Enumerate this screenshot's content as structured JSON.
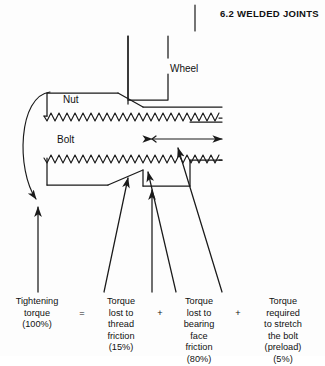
{
  "header": {
    "title": "6.2 WELDED JOINTS"
  },
  "diagram": {
    "labels": {
      "wheel": "Wheel",
      "nut": "Nut",
      "bolt": "Bolt"
    },
    "annotations": {
      "stretch_arrow": "double-headed-arrow",
      "tightening_arc": "curved-torque-arrow"
    },
    "colors": {
      "line": "#1a1a1a",
      "background": "#fdfdfd",
      "text": "#111111"
    }
  },
  "caption": {
    "operators": {
      "equals": "=",
      "plus": "+"
    },
    "columns": [
      {
        "lines": [
          "Tightening",
          "torque",
          "(100%)"
        ],
        "percent": "100%"
      },
      {
        "lines": [
          "Torque",
          "lost to",
          "thread",
          "friction",
          "(15%)"
        ],
        "percent": "15%"
      },
      {
        "lines": [
          "Torque",
          "lost to",
          "bearing",
          "face",
          "friction",
          "(80%)"
        ],
        "percent": "80%"
      },
      {
        "lines": [
          "Torque",
          "required",
          "to stretch",
          "the bolt",
          "(preload)",
          "(5%)"
        ],
        "percent": "5%"
      }
    ]
  }
}
